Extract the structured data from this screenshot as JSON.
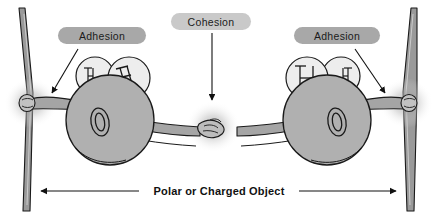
{
  "figure": {
    "background_color": "#ffffff"
  },
  "labels": {
    "adhesion_left": "Adhesion",
    "cohesion": "Cohesion",
    "adhesion_right": "Adhesion",
    "bottom_axis": "Polar or Charged Object"
  },
  "colors": {
    "label_pill_dark": "#a8a8a8",
    "label_pill_light": "#c9c9c9",
    "label_text": "#1b1b1b",
    "molecule_fill": "#b0b0b0",
    "hydrogen_fill": "#ededed",
    "arm_fill": "#a5a5a5",
    "post_fill": "#9a9a9a",
    "outline": "#1a1a1a",
    "glow": "#b8b8b8"
  },
  "molecules": [
    {
      "name": "water-molecule-left",
      "oxygen_letter": "O",
      "hydrogen_letters": [
        "H",
        "H"
      ]
    },
    {
      "name": "water-molecule-right",
      "oxygen_letter": "O",
      "hydrogen_letters": [
        "H",
        "H"
      ]
    }
  ],
  "arrows": {
    "adhesion_left": "arrow pointing down-left to left hand grip",
    "cohesion": "arrow pointing down to central handshake",
    "adhesion_right": "arrow pointing down-right to right hand grip",
    "axis_left": "left-pointing arrowhead",
    "axis_right": "right-pointing arrowhead"
  },
  "icons": {
    "left_post": "vertical-post-icon",
    "right_post": "vertical-post-icon",
    "handshake": "handshake-icon",
    "grip_left": "hand-grip-icon",
    "grip_right": "hand-grip-icon"
  }
}
